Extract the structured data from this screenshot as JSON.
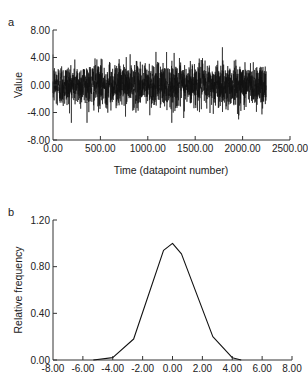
{
  "chart_data": [
    {
      "panel": "a",
      "type": "line",
      "title": "",
      "xlabel": "Time (datapoint number)",
      "ylabel": "Value",
      "xlim": [
        0,
        2500
      ],
      "ylim": [
        -8,
        8
      ],
      "xticks": [
        0,
        500,
        1000,
        1500,
        2000,
        2500
      ],
      "xtick_labels": [
        "0.00",
        "500.00",
        "1000.00",
        "1500.00",
        "2000.00",
        "2500.00"
      ],
      "yticks": [
        8,
        4,
        0,
        -4,
        -8
      ],
      "ytick_labels": [
        "8.00",
        "4.00",
        "0.00",
        "-4.00",
        "-8.00"
      ],
      "grid": false,
      "series": [
        {
          "name": "signal",
          "description": "Gaussian white noise time series, mean ~0, std ~1.6, approx. 2250 datapoints, range about -5.5 to 5.5",
          "n_points": 2250,
          "mean": 0.0,
          "std": 1.6,
          "min": -5.5,
          "max": 5.5,
          "color": "#111111"
        }
      ]
    },
    {
      "panel": "b",
      "type": "line",
      "title": "",
      "xlabel": "",
      "ylabel": "Relative frequency",
      "xlim": [
        -8,
        8
      ],
      "ylim": [
        0,
        1.2
      ],
      "xticks": [
        -8,
        -6,
        -4,
        -2,
        0,
        2,
        4,
        6,
        8
      ],
      "xtick_labels": [
        "-8.00",
        "-6.00",
        "-4.00",
        "-2.00",
        "0.00",
        "2.00",
        "4.00",
        "6.00",
        "8.00"
      ],
      "yticks": [
        1.2,
        0.8,
        0.4,
        0.0
      ],
      "ytick_labels": [
        "1.20",
        "0.80",
        "0.40",
        "0.00"
      ],
      "grid": false,
      "series": [
        {
          "name": "distribution",
          "x": [
            -5.3,
            -4.0,
            -2.6,
            -0.6,
            0.0,
            0.6,
            2.7,
            4.0,
            4.6
          ],
          "y": [
            0.0,
            0.02,
            0.18,
            0.94,
            1.0,
            0.91,
            0.2,
            0.02,
            0.0
          ],
          "color": "#111111"
        }
      ]
    }
  ],
  "labels": {
    "panel_a": "a",
    "panel_b": "b"
  }
}
